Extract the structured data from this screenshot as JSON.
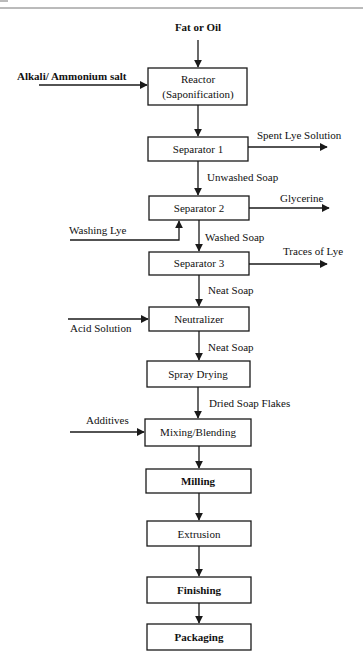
{
  "diagram": {
    "type": "process-flowchart",
    "inputs": {
      "top": "Fat or Oil",
      "alkali": "Alkali/ Ammonium salt",
      "washing_lye": "Washing Lye",
      "acid": "Acid Solution",
      "additives": "Additives"
    },
    "outputs": {
      "spent_lye": "Spent Lye Solution",
      "glycerine": "Glycerine",
      "traces_lye": "Traces of Lye"
    },
    "steps": [
      {
        "id": "reactor",
        "line1": "Reactor",
        "line2": "(Saponification)"
      },
      {
        "id": "separator1",
        "label": "Separator 1"
      },
      {
        "id": "separator2",
        "label": "Separator 2"
      },
      {
        "id": "separator3",
        "label": "Separator 3"
      },
      {
        "id": "neutralizer",
        "label": "Neutralizer"
      },
      {
        "id": "spray-drying",
        "label": "Spray Drying"
      },
      {
        "id": "mixing",
        "label": "Mixing/Blending"
      },
      {
        "id": "milling",
        "label": "Milling"
      },
      {
        "id": "extrusion",
        "label": "Extrusion"
      },
      {
        "id": "finishing",
        "label": "Finishing"
      },
      {
        "id": "packaging",
        "label": "Packaging"
      }
    ],
    "flow_labels": {
      "unwashed_soap": "Unwashed Soap",
      "washed_soap": "Washed Soap",
      "neat_soap_1": "Neat Soap",
      "neat_soap_2": "Neat Soap",
      "dried_flakes": "Dried Soap Flakes"
    },
    "colors": {
      "stroke": "#1a1a1a",
      "text": "#111111",
      "background": "#ffffff"
    }
  }
}
